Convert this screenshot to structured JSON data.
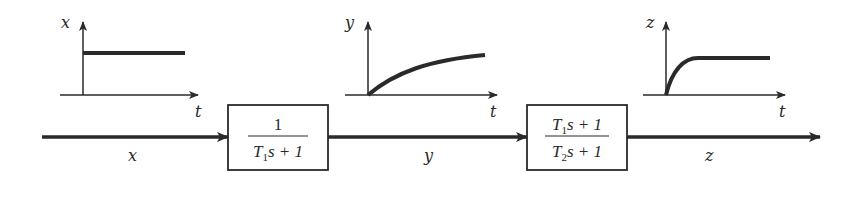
{
  "diagram": {
    "type": "block-diagram",
    "signals": {
      "input": "x",
      "intermediate": "y",
      "output": "z"
    },
    "blocks": [
      {
        "id": "block1",
        "numerator": "1",
        "denominator": {
          "T": "T",
          "sub": "1",
          "rest": "s + 1"
        }
      },
      {
        "id": "block2",
        "numerator": {
          "T": "T",
          "sub": "1",
          "rest": "s + 1"
        },
        "denominator": {
          "T": "T",
          "sub": "2",
          "rest": "s + 1"
        }
      }
    ],
    "plots": [
      {
        "id": "plot-x",
        "y_label": "x",
        "x_label": "t",
        "shape": "step"
      },
      {
        "id": "plot-y",
        "y_label": "y",
        "x_label": "t",
        "shape": "slow-exponential-rise"
      },
      {
        "id": "plot-z",
        "y_label": "z",
        "x_label": "t",
        "shape": "fast-exponential-rise"
      }
    ],
    "colors": {
      "stroke": "#2a2a2a",
      "background": "#ffffff"
    }
  }
}
